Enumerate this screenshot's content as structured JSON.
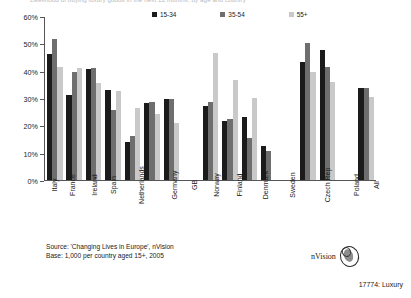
{
  "title_clipped": "Likelihood of buying luxury goods in the next 12 months, by age and country",
  "legend": [
    {
      "label": "15-34",
      "color": "#1b1b1b"
    },
    {
      "label": "35-54",
      "color": "#6e6e6e"
    },
    {
      "label": "55+",
      "color": "#c9c9c9"
    }
  ],
  "footer": {
    "source": "Source: 'Changing Lives in Europe', nVision",
    "base": "Base: 1,000 per country aged 15+, 2005"
  },
  "logo": {
    "word": "nVision",
    "mark": "oval-logo-icon"
  },
  "caption": "17774: Luxury",
  "chart_data": {
    "type": "bar",
    "title": "Likelihood of buying luxury goods in the next 12 months, by age and country",
    "xlabel": "",
    "ylabel": "",
    "ylim": [
      0,
      60
    ],
    "ytick_labels": [
      "0%",
      "10%",
      "20%",
      "30%",
      "40%",
      "50%",
      "60%"
    ],
    "ytick_values": [
      0,
      10,
      20,
      30,
      40,
      50,
      60
    ],
    "grid": false,
    "legend_position": "top-center",
    "categories": [
      "Italy",
      "France",
      "Ireland",
      "Spain",
      "Netherlands",
      "Germany",
      "GB",
      "",
      "Norway",
      "Finland",
      "Denmark",
      "Sweden",
      "",
      "Czech Rep",
      "Poland",
      "",
      "All"
    ],
    "series": [
      {
        "name": "15-34",
        "color": "#1b1b1b",
        "values": [
          46,
          31,
          40.5,
          33,
          14,
          28,
          29.5,
          null,
          27,
          21.5,
          23,
          12.5,
          null,
          43,
          47.5,
          null,
          33.5
        ]
      },
      {
        "name": "35-54",
        "color": "#6e6e6e",
        "values": [
          51.5,
          39.5,
          41,
          25.5,
          16,
          28.5,
          29.5,
          null,
          28.5,
          22.5,
          15.5,
          10.5,
          null,
          50,
          41.5,
          null,
          33.5
        ]
      },
      {
        "name": "55+",
        "color": "#c9c9c9",
        "values": [
          41.5,
          41,
          35.5,
          32.5,
          26.5,
          24,
          21,
          null,
          46.5,
          36.5,
          30,
          0,
          null,
          39.5,
          36,
          null,
          30.5
        ]
      }
    ]
  }
}
